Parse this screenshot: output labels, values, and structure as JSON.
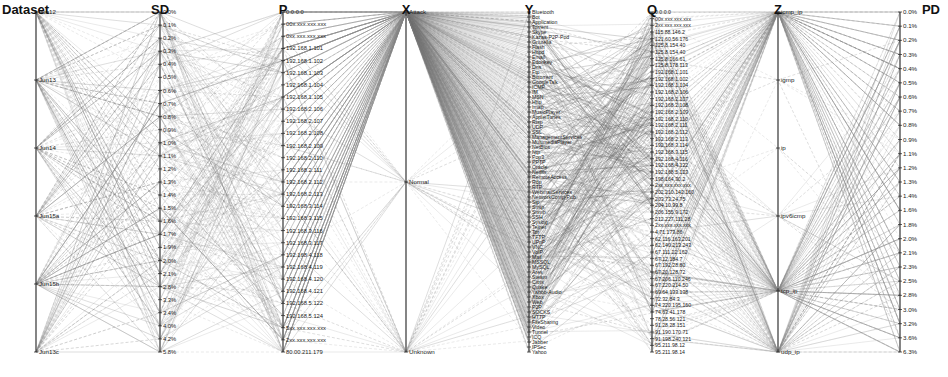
{
  "chart_data": {
    "type": "parallel_coordinates",
    "title": "",
    "grid": false,
    "legend": null,
    "line_color": "#888888",
    "axis_color": "#333333",
    "axes": [
      {
        "name": "Dataset",
        "x": 36,
        "label_align": "left",
        "ticks": [
          "Jun12",
          "Jun13",
          "Jun14",
          "Jun15a",
          "Jun15b",
          "Jun13c"
        ]
      },
      {
        "name": "SD",
        "x": 160,
        "ticks": [
          "0.0%",
          "0.1%",
          "0.2%",
          "0.3%",
          "0.4%",
          "0.5%",
          "0.6%",
          "0.7%",
          "0.8%",
          "0.9%",
          "1.0%",
          "1.1%",
          "1.2%",
          "1.3%",
          "1.4%",
          "1.5%",
          "1.6%",
          "1.7%",
          "1.9%",
          "2.0%",
          "2.1%",
          "2.8%",
          "3.3%",
          "3.4%",
          "4.0%",
          "4.2%",
          "5.8%"
        ]
      },
      {
        "name": "P",
        "x": 283,
        "ticks": [
          "0.0.0.0",
          "00x.xxx.xxx.xxx",
          "0xx.xxx.xxx.xxx",
          "192.168.1.101",
          "192.168.1.102",
          "192.168.1.103",
          "192.168.1.104",
          "192.168.1.105",
          "192.168.2.106",
          "192.168.2.107",
          "192.168.2.108",
          "192.168.2.109",
          "192.168.2.110",
          "192.168.2.111",
          "192.168.2.112",
          "192.168.2.113",
          "192.168.3.114",
          "192.168.3.115",
          "192.168.3.116",
          "192.168.3.117",
          "192.168.4.118",
          "192.168.4.119",
          "192.168.4.120",
          "192.168.4.121",
          "192.168.5.122",
          "192.168.5.124",
          "5xx.xxx.xxx.xxx",
          "2xx.xxx.xxx.xxx",
          "80.00.211.179"
        ]
      },
      {
        "name": "X",
        "x": 406,
        "ticks": [
          "Attack",
          "Normal",
          "Unknown"
        ]
      },
      {
        "name": "Y",
        "x": 529,
        "ticks": [
          "Bluetooth",
          "Bot",
          "Application",
          "Torrent",
          "Skype",
          "Kazaa-P2P-Pod",
          "Gnutella",
          "Flash",
          "Httpd",
          "Email",
          "Edonkey",
          "Dns",
          "Ftp",
          "Bittorrent",
          "GoogleTalk",
          "ICMP",
          "IM",
          "MSN",
          "Http",
          "Imap",
          "MusicPlayer",
          "AppleiTunes",
          "Rtsp",
          "UDP",
          "SSL",
          "ManagementServices",
          "MultimediaPlayer",
          "NetBios",
          "Ntp",
          "Pop3",
          "PPTP",
          "Oracle",
          "Netflix",
          "RemoteAccess",
          "Rdp",
          "RTP",
          "WebmailServices",
          "NetworkComp-Pub",
          "Sip",
          "Smtp",
          "Snmp",
          "SSH",
          "Syslog",
          "Telnet",
          "Tor",
          "TFTP",
          "UPnP",
          "VNC",
          "VoIP",
          "Mail",
          "MSSQL",
          "MySQL",
          "Ares",
          "Steam",
          "Citrix",
          "Quake",
          "Yahoo-Audio",
          "Xbox",
          "Web",
          "P2P",
          "SOCKS",
          "HTTP",
          "FileSharing",
          "Video",
          "Tunnel",
          "ICQ",
          "Jabber",
          "IPSec",
          "Yahoo"
        ]
      },
      {
        "name": "Q",
        "x": 652,
        "ticks": [
          "0.0.0.0",
          "00x.xxx.xxx.xxx",
          "2xx.xxx.xxx.xxx",
          "115.88.146.2",
          "121.60.56.176",
          "125.8.154.40",
          "125.8.154.40",
          "125.8.166.61",
          "125.8.178.113",
          "192.168.1.101",
          "192.168.1.102",
          "192.168.1.104",
          "192.168.2.106",
          "192.168.2.107",
          "192.168.2.108",
          "192.168.2.109",
          "192.168.2.110",
          "192.168.2.111",
          "192.168.2.112",
          "192.168.2.113",
          "192.168.3.114",
          "192.168.3.115",
          "192.168.4.116",
          "192.168.4.122",
          "192.168.5.123",
          "198.164.30.2",
          "2xx.xxx.xxx.xxx",
          "202.210.142.160",
          "203.73.24.75",
          "204.10.99.8",
          "206.155.9.172",
          "212.227.111.28",
          "2xx.xxx.xxx.xxx",
          "4.71.173.86",
          "62.116.163.201",
          "62.140.213.243",
          "67.111.22.162",
          "67.12.184.7",
          "67.192.28.80",
          "67.20.128.72",
          "67.206.110.246",
          "67.220.214.50",
          "69.64.133.138",
          "72.32.84.3",
          "74.220.195.160",
          "74.63.41.178",
          "78.28.56.121",
          "91.28.28.151",
          "91.190.170.71",
          "91.198.240.121",
          "95.211.98.12",
          "95.211.98.14"
        ]
      },
      {
        "name": "Z",
        "x": 778,
        "ticks": [
          "icmp_ip",
          "igmp",
          "ip",
          "ipv6icmp",
          "tcp_ip",
          "udp_ip"
        ],
        "tick_positions_frac": [
          0.0,
          0.2,
          0.4,
          0.6,
          0.82,
          1.0
        ]
      },
      {
        "name": "PD",
        "x": 900,
        "label_align": "right",
        "ticks": [
          "0.0%",
          "0.1%",
          "0.2%",
          "0.3%",
          "0.4%",
          "0.5%",
          "0.6%",
          "0.7%",
          "0.8%",
          "0.9%",
          "1.1%",
          "1.2%",
          "1.3%",
          "1.4%",
          "1.6%",
          "1.8%",
          "2.0%",
          "2.1%",
          "2.3%",
          "2.5%",
          "2.8%",
          "3.0%",
          "3.2%",
          "3.6%",
          "6.3%"
        ]
      }
    ],
    "axis_top_y": 12,
    "axis_bottom_y": 352
  }
}
